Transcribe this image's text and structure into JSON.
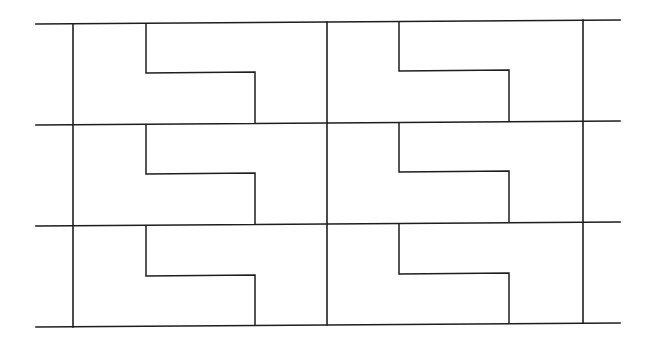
{
  "diagram": {
    "title": "",
    "canvas": {
      "width": 645,
      "height": 344
    },
    "line_color": "#1e1e1e",
    "background": "#ffffff",
    "grid": {
      "rows": 3,
      "cols": 2,
      "horizontal_lines": [
        {
          "name": "top",
          "x1": 36,
          "y1": 24,
          "x2": 620,
          "y2": 20
        },
        {
          "name": "row-1",
          "x1": 36,
          "y1": 125,
          "x2": 620,
          "y2": 121
        },
        {
          "name": "row-2",
          "x1": 36,
          "y1": 226,
          "x2": 620,
          "y2": 222
        },
        {
          "name": "bottom",
          "x1": 36,
          "y1": 327,
          "x2": 620,
          "y2": 323
        }
      ],
      "vertical_lines": [
        {
          "name": "left",
          "x1": 73,
          "y1": 24,
          "x2": 73,
          "y2": 327
        },
        {
          "name": "center",
          "x1": 327,
          "y1": 22,
          "x2": 327,
          "y2": 325
        },
        {
          "name": "right",
          "x1": 583,
          "y1": 20,
          "x2": 583,
          "y2": 323
        }
      ]
    },
    "cells": [
      {
        "row": 0,
        "col": 0,
        "path": [
          [
            146,
            23
          ],
          [
            146,
            73
          ],
          [
            255,
            72
          ],
          [
            255,
            124
          ]
        ]
      },
      {
        "row": 0,
        "col": 1,
        "path": [
          [
            399,
            21
          ],
          [
            399,
            71
          ],
          [
            509,
            70
          ],
          [
            509,
            122
          ]
        ]
      },
      {
        "row": 1,
        "col": 0,
        "path": [
          [
            146,
            124
          ],
          [
            146,
            174
          ],
          [
            255,
            173
          ],
          [
            255,
            225
          ]
        ]
      },
      {
        "row": 1,
        "col": 1,
        "path": [
          [
            399,
            122
          ],
          [
            399,
            172
          ],
          [
            509,
            171
          ],
          [
            509,
            223
          ]
        ]
      },
      {
        "row": 2,
        "col": 0,
        "path": [
          [
            146,
            225
          ],
          [
            146,
            276
          ],
          [
            255,
            275
          ],
          [
            255,
            326
          ]
        ]
      },
      {
        "row": 2,
        "col": 1,
        "path": [
          [
            399,
            223
          ],
          [
            399,
            274
          ],
          [
            509,
            273
          ],
          [
            509,
            324
          ]
        ]
      }
    ]
  }
}
